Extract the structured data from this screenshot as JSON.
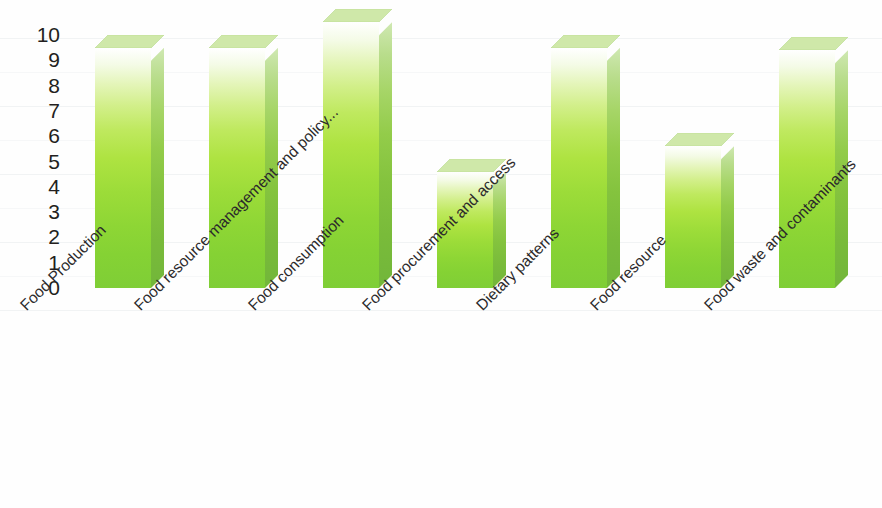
{
  "chart_data": {
    "type": "bar",
    "title": "",
    "subtitle": "",
    "xlabel": "",
    "ylabel": "",
    "ylim": [
      0,
      10
    ],
    "grid": false,
    "legend": false,
    "style": "3d-column",
    "bar_color_top": "#ffffff",
    "bar_color_mid": "#bfe95f",
    "bar_color_bottom": "#7fce36",
    "bar_side_color": "#72b63a",
    "bar_top_face_color": "#cfe8a9",
    "categories": [
      "Food Production",
      "Food resource management and policy...",
      "Food consumption",
      "Food procurement and access",
      "Dietary patterns",
      "Food resource",
      "Food waste and contaminants"
    ],
    "values": [
      9.5,
      9.5,
      10.5,
      4.6,
      9.5,
      5.6,
      9.4
    ],
    "y_ticks": [
      "10",
      "9",
      "8",
      "7",
      "6",
      "5",
      "4",
      "3",
      "2",
      "1",
      "0"
    ],
    "y_tick_values": [
      10,
      9,
      8,
      7,
      6,
      5,
      4,
      3,
      2,
      1,
      0
    ]
  },
  "axis": {
    "y_labels": [
      "10",
      "9",
      "8",
      "7",
      "6",
      "5",
      "4",
      "3",
      "2",
      "1",
      "0"
    ]
  },
  "categories": {
    "items": [
      {
        "label": "Food Production"
      },
      {
        "label": "Food resource management and policy..."
      },
      {
        "label": "Food consumption"
      },
      {
        "label": "Food procurement and access"
      },
      {
        "label": "Dietary patterns"
      },
      {
        "label": "Food resource"
      },
      {
        "label": "Food waste and contaminants"
      }
    ]
  }
}
